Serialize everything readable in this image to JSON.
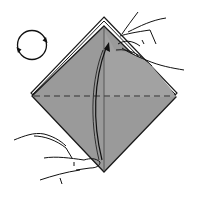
{
  "diagram": {
    "type": "origami-instruction-step",
    "colors": {
      "paper_fill": "#9a9a9a",
      "paper_edge": "#1a1a1a",
      "layer_edge_light": "#d8d8d8",
      "background": "#ffffff",
      "line": "#111111"
    },
    "elements": {
      "rotate_symbol": {
        "icon": "rotate-clockwise-icon"
      },
      "paper": {
        "shape": "diamond"
      },
      "fold_line": {
        "style": "dashed",
        "orientation": "horizontal"
      },
      "fold_arrow": {
        "direction": "up",
        "icon": "curved-arrow-icon"
      },
      "hand_top": {
        "icon": "hand-icon"
      },
      "hand_bottom": {
        "icon": "hand-icon"
      }
    }
  }
}
